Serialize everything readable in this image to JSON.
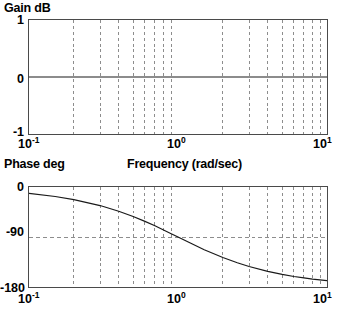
{
  "figure": {
    "kind": "bode-plot",
    "background_color": "#ffffff",
    "axis_color": "#4a4a4a",
    "grid_color": "#8c8c8c",
    "curve_color": "#1a1a1a",
    "xlabel": "Frequency (rad/sec)"
  },
  "gain_panel": {
    "heading": "Gain dB",
    "ytick_labels": [
      "1",
      "0",
      "-1"
    ],
    "xtick_labels": [
      {
        "mantissa": "10",
        "exponent": "-1"
      },
      {
        "mantissa": "10",
        "exponent": "0"
      },
      {
        "mantissa": "10",
        "exponent": "1"
      }
    ]
  },
  "phase_panel": {
    "heading": "Phase deg",
    "ytick_labels": [
      "0",
      "-90",
      "-180"
    ],
    "xtick_labels": [
      {
        "mantissa": "10",
        "exponent": "-1"
      },
      {
        "mantissa": "10",
        "exponent": "0"
      },
      {
        "mantissa": "10",
        "exponent": "1"
      }
    ]
  },
  "chart_data": [
    {
      "type": "line",
      "title": "Gain dB",
      "xlabel": "Frequency (rad/sec)",
      "ylabel": "Gain dB",
      "xscale": "log",
      "xlim": [
        0.1,
        10
      ],
      "ylim": [
        -1,
        1
      ],
      "yticks": [
        -1,
        0,
        1
      ],
      "xticks": [
        0.1,
        1,
        10
      ],
      "grid": true,
      "grid_style": "dashed-vertical-log-minor",
      "legend": "none",
      "series": [
        {
          "name": "Gain",
          "x": [
            0.1,
            0.2,
            0.3,
            0.5,
            0.7,
            1,
            2,
            3,
            5,
            7,
            10
          ],
          "values": [
            0,
            0,
            0,
            0,
            0,
            0,
            0,
            0,
            0,
            0,
            0
          ]
        }
      ]
    },
    {
      "type": "line",
      "title": "Phase deg",
      "xlabel": "Frequency (rad/sec)",
      "ylabel": "Phase deg",
      "xscale": "log",
      "xlim": [
        0.1,
        10
      ],
      "ylim": [
        -180,
        0
      ],
      "yticks": [
        -180,
        -90,
        0
      ],
      "xticks": [
        0.1,
        1,
        10
      ],
      "grid": true,
      "grid_style": "dashed-vertical-log-minor",
      "legend": "none",
      "series": [
        {
          "name": "Phase",
          "x": [
            0.1,
            0.15,
            0.2,
            0.3,
            0.4,
            0.5,
            0.6,
            0.7,
            0.8,
            0.9,
            1.0,
            1.2,
            1.5,
            2.0,
            2.5,
            3.0,
            4.0,
            5.0,
            6.0,
            7.0,
            8.0,
            10.0
          ],
          "values": [
            -11.4,
            -17.1,
            -22.6,
            -33.4,
            -43.6,
            -53.1,
            -61.9,
            -69.9,
            -77.3,
            -84.0,
            -90.0,
            -100.4,
            -113.0,
            -126.9,
            -136.4,
            -143.1,
            -151.9,
            -157.4,
            -161.1,
            -163.7,
            -165.8,
            -168.6
          ]
        }
      ]
    }
  ]
}
